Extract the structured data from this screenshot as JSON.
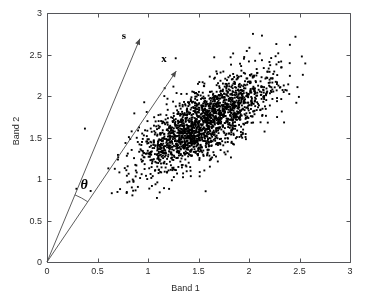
{
  "chart_data": {
    "type": "scatter",
    "title": "",
    "xlabel": "Band 1",
    "ylabel": "Band 2",
    "xlim": [
      0,
      3
    ],
    "ylim": [
      0,
      3
    ],
    "xticks": [
      "0",
      "0.5",
      "1",
      "1.5",
      "2",
      "2.5",
      "3"
    ],
    "yticks": [
      "0",
      "0.5",
      "1",
      "1.5",
      "2",
      "2.5",
      "3"
    ],
    "xtick_values": [
      0,
      0.5,
      1,
      1.5,
      2,
      2.5,
      3
    ],
    "ytick_values": [
      0,
      0.5,
      1,
      1.5,
      2,
      2.5,
      3
    ],
    "grid": false,
    "legend": "none",
    "point_color": "#000000",
    "point_count": 2000,
    "cluster": {
      "center": [
        1.55,
        1.68
      ],
      "major_axis_angle_deg": 42,
      "sigma_major": 0.42,
      "sigma_minor": 0.16,
      "description": "elongated diagonal point cloud of spectral pixels"
    },
    "annotations": [
      {
        "name": "s",
        "label": "s",
        "type": "vector",
        "from": [
          0,
          0
        ],
        "to": [
          0.92,
          2.69
        ],
        "label_position": [
          0.78,
          2.72
        ],
        "color": "#4a4a4a"
      },
      {
        "name": "x",
        "label": "x",
        "type": "vector",
        "from": [
          0,
          0
        ],
        "to": [
          1.28,
          2.3
        ],
        "label_position": [
          1.17,
          2.44
        ],
        "color": "#4a4a4a"
      },
      {
        "name": "theta",
        "label": "θ",
        "type": "angle-arc",
        "between": [
          "s",
          "x"
        ],
        "vertex": [
          0,
          0
        ],
        "radius_data": 1.0,
        "label_position": [
          0.38,
          0.92
        ],
        "color": "#4a4a4a"
      }
    ],
    "axis_color": "#55565a",
    "background": "#ffffff"
  },
  "figure": {
    "xlabel": "Band 1",
    "ylabel": "Band 2",
    "vector_s_label": "s",
    "vector_x_label": "x",
    "theta_label": "θ"
  }
}
